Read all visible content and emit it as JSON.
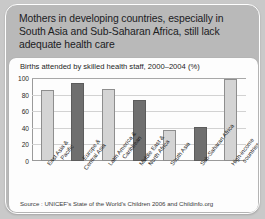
{
  "card": {
    "headline": "Mothers in developing countries, especially in South Asia and Sub-Saharan Africa, still lack adequate health care"
  },
  "panel": {
    "source": "Source : UNICEF's State of the World's Children 2006 and Childinfo.org"
  },
  "chart_data": {
    "type": "bar",
    "title": "Births attended by skilled health staff, 2000–2004 (%)",
    "xlabel": "",
    "ylabel": "",
    "ylim": [
      0,
      100
    ],
    "yticks": [
      100,
      80,
      60,
      40,
      20,
      0
    ],
    "grid": true,
    "legend": "none",
    "categories": [
      "East Asia & Pacific",
      "Europe & Central Asia",
      "Latin America & Caribbean",
      "Middle East & North Africa",
      "South Asia",
      "Sub-Saharan Africa",
      "High-income countries"
    ],
    "category_lines": [
      [
        "East Asia &",
        "Pacific"
      ],
      [
        "Europe &",
        "Central Asia"
      ],
      [
        "Latin America &",
        "Caribbean"
      ],
      [
        "Middle East &",
        "North Africa"
      ],
      [
        "South Asia"
      ],
      [
        "Sub-Saharan Africa"
      ],
      [
        "High-income",
        "countries"
      ]
    ],
    "values": [
      86,
      94,
      87,
      74,
      37,
      41,
      99
    ],
    "bar_shades": [
      "light",
      "dark",
      "light",
      "dark",
      "light",
      "dark",
      "light"
    ],
    "colors": {
      "bar_light": "#d4d4d4",
      "bar_dark": "#6f6f6f",
      "gridline": "#d2d2d2",
      "axis": "#9a9a9a",
      "panel_bg": "#fdfdfd",
      "card_bg": "#b9b9b9",
      "page_bg": "#c9c9c9"
    }
  }
}
